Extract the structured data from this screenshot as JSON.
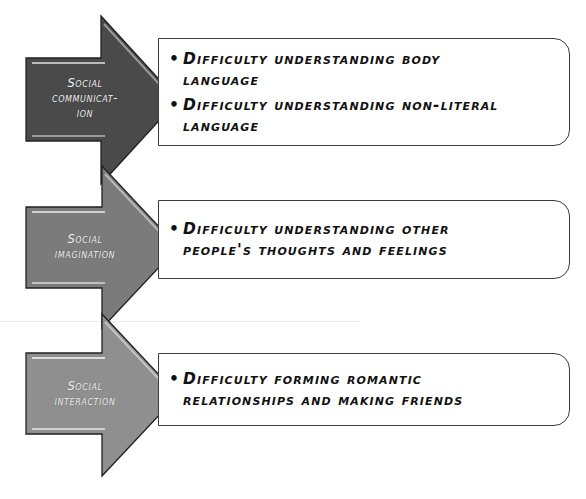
{
  "diagram": {
    "colors": {
      "arrow_1": "#4a4a4a",
      "arrow_2": "#7b7b7b",
      "arrow_3": "#8f8f8f",
      "box_border": "#3c3c3c",
      "text": "#111111",
      "label_text": "#f2f2f2"
    },
    "bullet_icon": "•",
    "rows": [
      {
        "label_lines": [
          "Social",
          "communicat-",
          "ion"
        ],
        "bullets": [
          "Difficulty understanding body language",
          "Difficulty understanding non-literal language"
        ]
      },
      {
        "label_lines": [
          "Social",
          "imagination"
        ],
        "bullets": [
          "Difficulty understanding other people's thoughts and feelings"
        ]
      },
      {
        "label_lines": [
          "Social",
          "interaction"
        ],
        "bullets": [
          "Difficulty forming romantic relationships and making friends"
        ]
      }
    ]
  }
}
